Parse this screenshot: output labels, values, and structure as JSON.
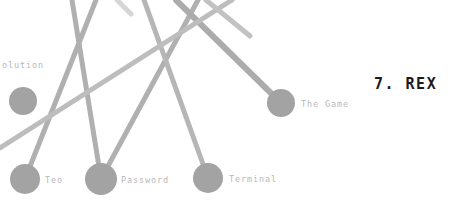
{
  "canvas": {
    "width": 468,
    "height": 205,
    "background": "#ffffff"
  },
  "rank_title": {
    "text": "7. REX",
    "color": "#1b1b1b",
    "x": 374,
    "y": 77
  },
  "graph": {
    "node_color": "#a3a3a3",
    "node_radius": 14,
    "edge_color": "#b0b0b0",
    "edge_color_light": "#cccccc",
    "edge_width": 5,
    "label_color": "#b9b9b9",
    "nodes": [
      {
        "id": "evolution",
        "label": "olution",
        "x": 23,
        "y": 101,
        "r": 14,
        "label_x": 2,
        "label_y": 65,
        "label_clipped": true
      },
      {
        "id": "teo",
        "label": "Teo",
        "x": 25,
        "y": 179,
        "r": 15,
        "label_x": 45,
        "label_y": 180,
        "label_clipped": false
      },
      {
        "id": "password",
        "label": "Password",
        "x": 101,
        "y": 179,
        "r": 16,
        "label_x": 121,
        "label_y": 180,
        "label_clipped": false
      },
      {
        "id": "terminal",
        "label": "Terminal",
        "x": 208,
        "y": 178,
        "r": 15,
        "label_x": 229,
        "label_y": 179,
        "label_clipped": false
      },
      {
        "id": "the_game",
        "label": "The Game",
        "x": 281,
        "y": 103,
        "r": 14,
        "label_x": 301,
        "label_y": 104,
        "label_clipped": false
      }
    ],
    "edges": [
      {
        "id": "edge-teo-up",
        "from": "teo",
        "x1": 25,
        "y1": 179,
        "x2": 96,
        "y2": 0,
        "width": 5,
        "color": "#b0b0b0"
      },
      {
        "id": "edge-password-upleft",
        "from": "password",
        "x1": 101,
        "y1": 179,
        "x2": 72,
        "y2": 0,
        "width": 5,
        "color": "#b0b0b0"
      },
      {
        "id": "edge-password-upright",
        "from": "password",
        "x1": 101,
        "y1": 179,
        "x2": 198,
        "y2": 0,
        "width": 5,
        "color": "#b0b0b0"
      },
      {
        "id": "edge-terminal-upleft",
        "from": "terminal",
        "x1": 208,
        "y1": 178,
        "x2": 144,
        "y2": 0,
        "width": 5,
        "color": "#b6b6b6"
      },
      {
        "id": "edge-thegame-upleft",
        "from": "the_game",
        "x1": 281,
        "y1": 103,
        "x2": 176,
        "y2": 0,
        "width": 6,
        "color": "#acacac"
      },
      {
        "id": "edge-long-diagonal",
        "from": "crossing",
        "x1": 0,
        "y1": 148,
        "x2": 232,
        "y2": 0,
        "width": 5,
        "color": "#bdbdbd"
      },
      {
        "id": "edge-upper-right-v",
        "from": "crossing",
        "x1": 206,
        "y1": 0,
        "x2": 250,
        "y2": 36,
        "width": 5,
        "color": "#c2c2c2"
      },
      {
        "id": "edge-faint-top-left",
        "from": "crossing",
        "x1": 117,
        "y1": 0,
        "x2": 131,
        "y2": 14,
        "width": 5,
        "color": "#d6d6d6"
      }
    ]
  }
}
